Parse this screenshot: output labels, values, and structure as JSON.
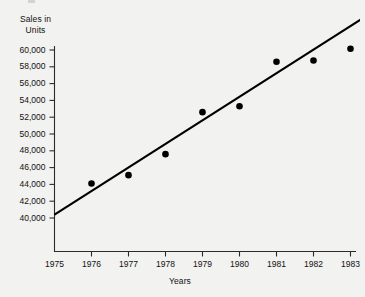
{
  "chart_data": {
    "type": "scatter",
    "title": "",
    "xlabel": "Years",
    "ylabel": "Sales in\nUnits",
    "x": [
      1976,
      1977,
      1978,
      1979,
      1980,
      1981,
      1982,
      1983
    ],
    "values": [
      44100,
      45100,
      47600,
      52600,
      53300,
      58600,
      58750,
      60150
    ],
    "series": [
      {
        "name": "Sales in Units",
        "values": [
          44100,
          45100,
          47600,
          52600,
          53300,
          58600,
          58750,
          60150
        ]
      },
      {
        "name": "Trend line",
        "type": "line",
        "x": [
          1975,
          1983.55
        ],
        "values": [
          40400,
          64400
        ]
      }
    ],
    "xlim": [
      1975,
      1983.55
    ],
    "ylim": [
      40000,
      60000
    ],
    "xticks": [
      1975,
      1976,
      1977,
      1978,
      1979,
      1980,
      1981,
      1982,
      1983
    ],
    "yticks": [
      40000,
      42000,
      44000,
      46000,
      48000,
      50000,
      52000,
      54000,
      56000,
      58000,
      60000
    ],
    "xtick_labels": [
      "1975",
      "1976",
      "1977",
      "1978",
      "1979",
      "1980",
      "1981",
      "1982",
      "1983"
    ],
    "ytick_labels": [
      "40,000",
      "42,000",
      "44,000",
      "46,000",
      "48,000",
      "50,000",
      "52,000",
      "54,000",
      "56,000",
      "58,000",
      "60,000"
    ],
    "grid": false,
    "legend": "none",
    "marker_color": "#000000",
    "line_color": "#000000",
    "axis_color": "#2b2b2b",
    "background_color": "#f2f2f0"
  },
  "labels": {
    "y_axis_title": "Sales in\nUnits",
    "x_axis_title": "Years"
  }
}
